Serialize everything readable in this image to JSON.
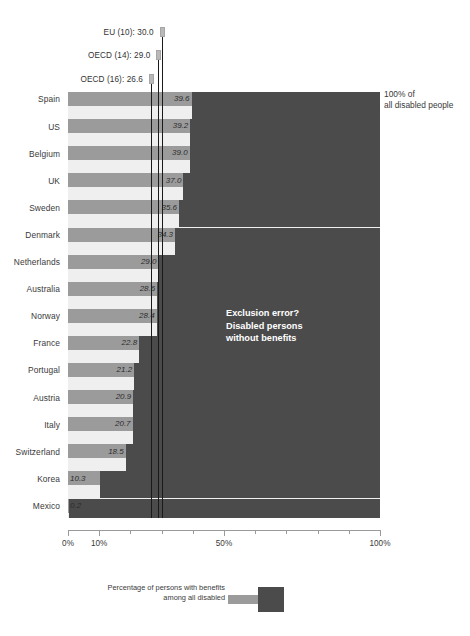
{
  "chart_data": {
    "type": "bar",
    "title": "",
    "subtitle": "",
    "xlabel": "",
    "ylabel": "",
    "orientation": "horizontal",
    "stacked": true,
    "xlim": [
      0,
      100
    ],
    "xticks": [
      0,
      10,
      20,
      30,
      40,
      50,
      60,
      70,
      80,
      90,
      100
    ],
    "xtick_labels": [
      "0%",
      "10%",
      "",
      "",
      "",
      "50%",
      "",
      "",
      "",
      "",
      "100%"
    ],
    "grid": false,
    "legend_position": "bottom",
    "categories": [
      "Spain",
      "US",
      "Belgium",
      "UK",
      "Sweden",
      "Denmark",
      "Netherlands",
      "Australia",
      "Norway",
      "France",
      "Portugal",
      "Austria",
      "Italy",
      "Switzerland",
      "Korea",
      "Mexico"
    ],
    "values": [
      39.6,
      39.2,
      39.0,
      37.0,
      35.6,
      34.3,
      29.0,
      28.6,
      28.4,
      22.8,
      21.2,
      20.9,
      20.7,
      18.5,
      10.3,
      0.2
    ],
    "value_labels": [
      "39.6",
      "39.2",
      "39.0",
      "37.0",
      "35.6",
      "34.3",
      "29.0",
      "28.6",
      "28.4",
      "22.8",
      "21.2",
      "20.9",
      "20.7",
      "18.5",
      "10.3",
      "0.2"
    ],
    "series": [
      {
        "name": "Percentage of persons with benefits among all disabled",
        "color": "#9b9b9b",
        "values": [
          39.6,
          39.2,
          39.0,
          37.0,
          35.6,
          34.3,
          29.0,
          28.6,
          28.4,
          22.8,
          21.2,
          20.9,
          20.7,
          18.5,
          10.3,
          0.2
        ]
      },
      {
        "name": "Exclusion error? Disabled persons without benefits",
        "color": "#4b4b4b",
        "values": [
          60.4,
          60.8,
          61.0,
          63.0,
          64.4,
          65.7,
          71.0,
          71.4,
          71.6,
          77.2,
          78.8,
          79.1,
          79.3,
          81.5,
          89.7,
          99.8
        ]
      }
    ],
    "reference_lines": [
      {
        "id": "eu10",
        "label": "EU (10): 30.0",
        "value": 30.0
      },
      {
        "id": "oecd14",
        "label": "OECD (14): 29.0",
        "value": 29.0
      },
      {
        "id": "oecd16",
        "label": "OECD (16): 26.6",
        "value": 26.6
      }
    ],
    "annotations": [
      {
        "id": "exclusion",
        "lines": [
          "Exclusion error?",
          "Disabled persons",
          "without benefits"
        ]
      },
      {
        "id": "total",
        "lines": [
          "100% of",
          "all disabled people"
        ]
      }
    ]
  },
  "reference": {
    "line_0_label": "EU (10): 30.0",
    "line_1_label": "OECD (14): 29.0",
    "line_2_label": "OECD (16): 26.6"
  },
  "annotation": {
    "exclusion_line_1": "Exclusion error?",
    "exclusion_line_2": "Disabled persons",
    "exclusion_line_3": "without benefits",
    "total_line_1": "100% of",
    "total_line_2": "all disabled people"
  },
  "legend": {
    "text_line_1": "Percentage of persons with benefits",
    "text_line_2": "among all disabled"
  },
  "colors": {
    "bar_light": "#9b9b9b",
    "bar_dark": "#4b4b4b",
    "plot_background": "#efefef",
    "axis": "#9a9a9a"
  }
}
